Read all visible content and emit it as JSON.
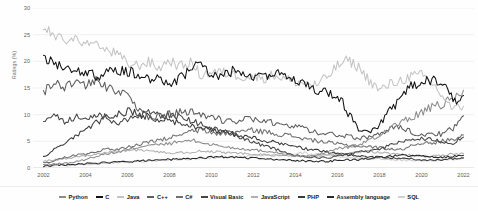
{
  "chart_data": {
    "type": "line",
    "title": "",
    "xlabel": "",
    "ylabel": "Ratings (%)",
    "xlim": [
      2001.5,
      2022.5
    ],
    "ylim": [
      0,
      30
    ],
    "grid": true,
    "legend_position": "bottom",
    "y_ticks": [
      0,
      5,
      10,
      15,
      20,
      25,
      30
    ],
    "x_ticks": [
      2002,
      2004,
      2006,
      2008,
      2010,
      2012,
      2014,
      2016,
      2018,
      2020,
      2022
    ],
    "x": [
      2002,
      2002.5,
      2003,
      2003.5,
      2004,
      2004.5,
      2005,
      2005.5,
      2006,
      2006.5,
      2007,
      2007.5,
      2008,
      2008.5,
      2009,
      2009.5,
      2010,
      2010.5,
      2011,
      2011.5,
      2012,
      2012.5,
      2013,
      2013.5,
      2014,
      2014.5,
      2015,
      2015.5,
      2016,
      2016.5,
      2017,
      2017.5,
      2018,
      2018.5,
      2019,
      2019.5,
      2020,
      2020.5,
      2021,
      2021.5,
      2022
    ],
    "series": [
      {
        "name": "Python",
        "color": "#8c8c8c",
        "values": [
          0.6,
          0.7,
          0.9,
          1.1,
          1.6,
          2.2,
          2.7,
          2.9,
          3.4,
          3.9,
          4.4,
          4.3,
          4.6,
          4.9,
          5.2,
          4.8,
          4.4,
          4.1,
          3.8,
          3.6,
          3.4,
          3.2,
          3.0,
          2.5,
          2.3,
          2.2,
          2.4,
          3.0,
          3.6,
          3.9,
          4.3,
          5.2,
          6.0,
          7.6,
          8.5,
          9.3,
          10.5,
          11.3,
          11.9,
          12.9,
          14.6
        ]
      },
      {
        "name": "C",
        "color": "#111111",
        "values": [
          20.2,
          19.7,
          19.0,
          18.5,
          17.8,
          17.2,
          17.8,
          18.4,
          18.1,
          17.6,
          16.9,
          16.5,
          15.7,
          17.0,
          18.3,
          19.8,
          17.5,
          17.2,
          18.1,
          17.3,
          16.8,
          17.5,
          17.6,
          17.9,
          16.5,
          15.2,
          14.7,
          14.2,
          13.8,
          10.4,
          7.3,
          6.8,
          8.0,
          10.8,
          12.6,
          15.5,
          16.2,
          16.5,
          15.9,
          12.6,
          13.6
        ]
      },
      {
        "name": "Java",
        "color": "#c4c4c4",
        "values": [
          26.4,
          24.7,
          23.8,
          24.4,
          23.2,
          22.9,
          22.0,
          21.4,
          19.5,
          19.2,
          19.9,
          18.7,
          20.2,
          19.0,
          19.8,
          17.4,
          18.0,
          17.9,
          17.6,
          17.2,
          17.1,
          16.9,
          17.5,
          16.7,
          16.2,
          15.9,
          15.5,
          17.0,
          19.2,
          20.2,
          18.9,
          16.5,
          14.5,
          15.7,
          16.4,
          17.2,
          17.4,
          15.9,
          13.5,
          10.9,
          11.6
        ]
      },
      {
        "name": "C++",
        "color": "#5e5e5e",
        "values": [
          14.4,
          16.1,
          15.0,
          16.6,
          15.4,
          16.3,
          15.1,
          14.7,
          13.2,
          10.9,
          9.3,
          9.6,
          10.2,
          10.4,
          10.8,
          10.1,
          9.5,
          9.0,
          8.8,
          9.2,
          9.0,
          8.6,
          8.4,
          8.3,
          7.9,
          7.2,
          6.7,
          6.5,
          6.2,
          5.9,
          5.6,
          5.8,
          6.3,
          7.3,
          7.9,
          6.8,
          6.2,
          6.6,
          6.3,
          7.5,
          9.8
        ]
      },
      {
        "name": "C#",
        "color": "#707070",
        "values": [
          0.9,
          1.3,
          2.0,
          2.4,
          2.6,
          2.9,
          3.6,
          3.4,
          3.9,
          4.4,
          4.8,
          5.2,
          5.6,
          6.3,
          6.8,
          7.1,
          6.6,
          6.4,
          6.8,
          6.9,
          7.1,
          6.8,
          6.5,
          6.2,
          5.9,
          5.4,
          5.1,
          4.8,
          4.5,
          4.3,
          4.1,
          4.0,
          3.8,
          3.6,
          3.4,
          4.2,
          4.8,
          4.5,
          5.1,
          5.4,
          6.2
        ]
      },
      {
        "name": "Visual Basic",
        "color": "#454545",
        "values": [
          9.2,
          9.8,
          8.4,
          9.6,
          9.0,
          10.2,
          9.4,
          7.8,
          9.2,
          9.8,
          10.4,
          9.9,
          10.1,
          9.5,
          8.8,
          8.2,
          7.4,
          6.8,
          6.2,
          5.5,
          4.8,
          4.2,
          3.6,
          2.9,
          2.4,
          2.1,
          2.0,
          1.9,
          2.2,
          2.6,
          2.9,
          3.2,
          3.6,
          4.2,
          4.8,
          5.2,
          5.6,
          5.3,
          5.0,
          4.6,
          5.8
        ]
      },
      {
        "name": "JavaScript",
        "color": "#b0b0b0",
        "values": [
          1.3,
          1.5,
          1.8,
          2.0,
          2.3,
          2.6,
          2.9,
          3.1,
          3.3,
          3.4,
          3.2,
          3.0,
          2.8,
          2.9,
          3.0,
          3.2,
          3.1,
          2.9,
          2.8,
          2.7,
          2.6,
          2.5,
          2.4,
          2.3,
          2.2,
          2.1,
          2.2,
          2.4,
          2.6,
          2.8,
          3.0,
          3.1,
          2.9,
          2.7,
          2.5,
          2.4,
          2.3,
          2.2,
          2.4,
          2.6,
          2.7
        ]
      },
      {
        "name": "PHP",
        "color": "#3a3a3a",
        "values": [
          2.1,
          3.4,
          4.6,
          5.8,
          7.2,
          8.6,
          9.4,
          10.2,
          10.6,
          10.2,
          9.6,
          9.1,
          8.8,
          8.4,
          8.0,
          7.6,
          7.2,
          6.8,
          6.4,
          6.0,
          5.6,
          5.2,
          4.8,
          4.4,
          4.0,
          3.6,
          3.3,
          3.0,
          2.8,
          2.5,
          2.3,
          2.1,
          2.0,
          1.9,
          1.8,
          1.7,
          1.6,
          1.5,
          1.6,
          1.7,
          1.9
        ]
      },
      {
        "name": "Assembly language",
        "color": "#2a2a2a",
        "values": [
          0.4,
          0.5,
          0.6,
          0.7,
          0.8,
          0.9,
          1.0,
          1.1,
          1.2,
          1.3,
          1.4,
          1.5,
          1.6,
          1.7,
          1.8,
          1.9,
          2.0,
          2.1,
          2.0,
          1.9,
          1.8,
          1.7,
          1.6,
          1.5,
          1.4,
          1.3,
          1.2,
          1.3,
          1.4,
          1.5,
          1.6,
          1.8,
          2.0,
          2.2,
          2.4,
          2.3,
          2.2,
          2.1,
          2.0,
          2.2,
          2.4
        ]
      },
      {
        "name": "SQL",
        "color": "#d0d0d0",
        "values": [
          0.3,
          0.4,
          0.5,
          0.6,
          0.7,
          0.8,
          0.9,
          1.0,
          1.1,
          1.2,
          1.3,
          1.4,
          1.5,
          1.6,
          1.7,
          1.8,
          1.9,
          2.0,
          2.1,
          2.2,
          2.3,
          2.4,
          2.5,
          2.6,
          2.7,
          2.8,
          2.6,
          2.4,
          2.2,
          2.0,
          1.9,
          1.8,
          1.7,
          1.6,
          1.5,
          1.4,
          1.3,
          1.4,
          1.5,
          1.6,
          1.8
        ]
      }
    ]
  }
}
